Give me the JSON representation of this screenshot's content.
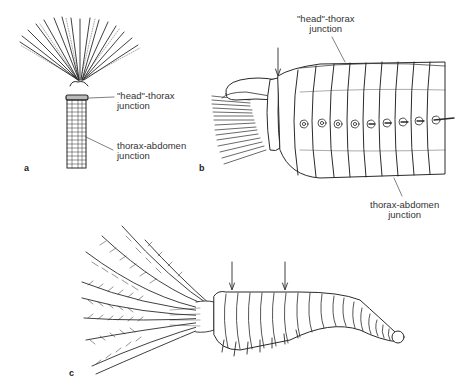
{
  "figure": {
    "panels": [
      {
        "id": "a",
        "label": "a",
        "annotations": [
          {
            "line1": "\"head\"-thorax",
            "line2": "junction"
          },
          {
            "line1": "thorax-abdomen",
            "line2": "junction"
          }
        ]
      },
      {
        "id": "b",
        "label": "b",
        "annotations": [
          {
            "line1": "\"head\"-thorax",
            "line2": "junction"
          },
          {
            "line1": "thorax-abdomen",
            "line2": "junction"
          }
        ]
      },
      {
        "id": "c",
        "label": "c",
        "arrows": 2
      }
    ],
    "colors": {
      "ink": "#2a2a2a",
      "background": "#ffffff"
    }
  }
}
